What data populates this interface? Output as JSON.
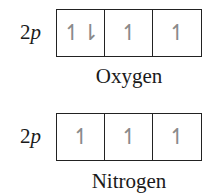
{
  "diagrams": [
    {
      "element": "Oxygen",
      "subshell": {
        "number": "2",
        "letter": "p"
      },
      "orbitals": [
        "↿⇂",
        "↿",
        "↿"
      ]
    },
    {
      "element": "Nitrogen",
      "subshell": {
        "number": "2",
        "letter": "p"
      },
      "orbitals": [
        "↿",
        "↿",
        "↿"
      ]
    }
  ]
}
